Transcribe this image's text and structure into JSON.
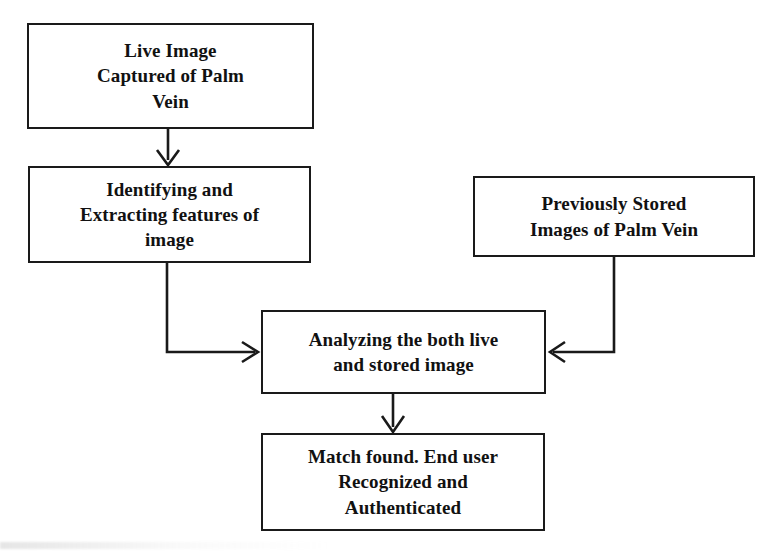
{
  "diagram": {
    "background_color": "#ffffff",
    "stroke_color": "#1a1a1a",
    "text_color": "#111111",
    "nodes": [
      {
        "id": "live-image",
        "label": "Live Image\nCaptured of Palm\nVein",
        "shape": "rectangle"
      },
      {
        "id": "identify",
        "label": "Identifying and\nExtracting features of\nimage",
        "shape": "rectangle"
      },
      {
        "id": "stored",
        "label": "Previously Stored\nImages of Palm Vein",
        "shape": "rectangle"
      },
      {
        "id": "analyze",
        "label": "Analyzing the both live\nand stored image",
        "shape": "rectangle"
      },
      {
        "id": "match",
        "label": "Match found. End user\nRecognized and\nAuthenticated",
        "shape": "rectangle"
      }
    ],
    "edges": [
      {
        "id": "edge-live-to-identify",
        "from": "live-image",
        "to": "identify",
        "style": "straight-down",
        "arrow": "down"
      },
      {
        "id": "edge-identify-to-analyze",
        "from": "identify",
        "to": "analyze",
        "style": "elbow-down-right",
        "arrow": "right"
      },
      {
        "id": "edge-stored-to-analyze",
        "from": "stored",
        "to": "analyze",
        "style": "elbow-down-left",
        "arrow": "left"
      },
      {
        "id": "edge-analyze-to-match",
        "from": "analyze",
        "to": "match",
        "style": "straight-down",
        "arrow": "down"
      }
    ]
  }
}
